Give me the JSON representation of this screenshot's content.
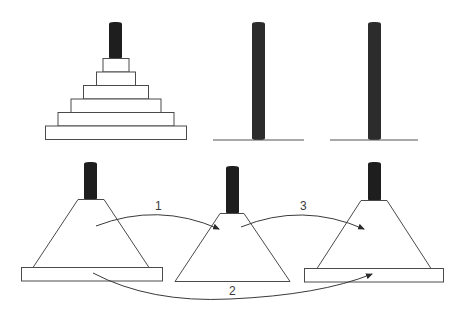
{
  "diagram": {
    "type": "tower-of-hanoi-recursive-decomposition",
    "top_row": {
      "pegs": [
        {
          "id": "A",
          "disks": 6
        },
        {
          "id": "B",
          "disks": 0
        },
        {
          "id": "C",
          "disks": 0
        }
      ]
    },
    "bottom_row": {
      "pegs": [
        {
          "id": "A",
          "content": "stack of n-1 disks on top of largest disk"
        },
        {
          "id": "B",
          "content": "stack of n-1 disks"
        },
        {
          "id": "C",
          "content": "stack of n-1 disks on top of largest disk"
        }
      ],
      "moves": [
        {
          "label": "1",
          "from": "A-stack",
          "to": "B"
        },
        {
          "label": "2",
          "from": "A-largest",
          "to": "C"
        },
        {
          "label": "3",
          "from": "B-stack",
          "to": "C"
        }
      ]
    },
    "colors": {
      "peg": "#1e1e1e",
      "outline": "#4a4a4a",
      "background": "#ffffff"
    }
  }
}
